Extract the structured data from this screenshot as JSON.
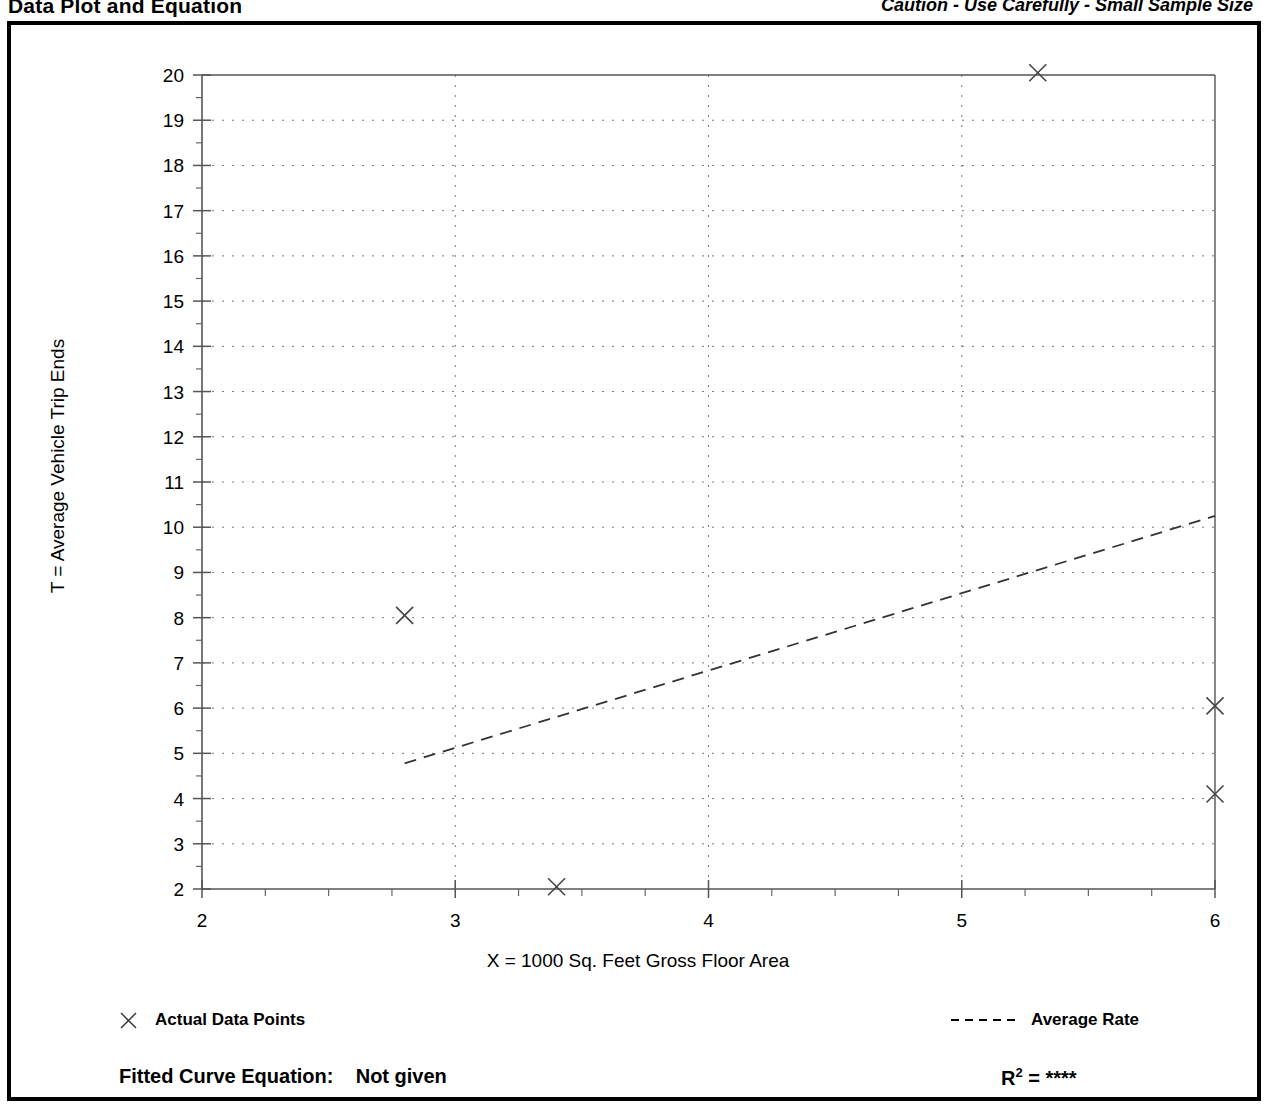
{
  "header": {
    "title": "Data Plot and Equation",
    "caution": "Caution - Use Carefully - Small Sample Size"
  },
  "legend": {
    "data_points_label": "Actual Data Points",
    "average_rate_label": "Average Rate",
    "marker_icon": "x-marker-icon",
    "line_icon": "dashed-line-icon"
  },
  "footer": {
    "equation_label": "Fitted Curve Equation:",
    "equation_value": "Not given",
    "r_squared_label": "R",
    "r_squared_exponent": "2",
    "r_squared_eq": "=",
    "r_squared_value": "****"
  },
  "chart_data": {
    "type": "scatter",
    "title": "Data Plot and Equation",
    "xlabel": "X = 1000 Sq. Feet Gross Floor Area",
    "ylabel": "T = Average Vehicle Trip Ends",
    "xlim": [
      2,
      6
    ],
    "ylim": [
      2,
      20
    ],
    "xticks": [
      2,
      3,
      4,
      5,
      6
    ],
    "xtick_labels": [
      "2",
      "3",
      "4",
      "5",
      "6"
    ],
    "yticks": [
      2,
      3,
      4,
      5,
      6,
      7,
      8,
      9,
      10,
      11,
      12,
      13,
      14,
      15,
      16,
      17,
      18,
      19,
      20
    ],
    "ytick_labels": [
      "2",
      "3",
      "4",
      "5",
      "6",
      "7",
      "8",
      "9",
      "10",
      "11",
      "12",
      "13",
      "14",
      "15",
      "16",
      "17",
      "18",
      "19",
      "20"
    ],
    "x_minor_tick_step": 0.25,
    "y_minor_tick_step": 0.5,
    "grid": true,
    "grid_style": "dotted",
    "legend_position": "below-plot",
    "series": [
      {
        "name": "Actual Data Points",
        "type": "scatter",
        "marker": "x",
        "points": [
          {
            "x": 2.8,
            "y": 8.05
          },
          {
            "x": 3.4,
            "y": 2.05
          },
          {
            "x": 5.3,
            "y": 20.05
          },
          {
            "x": 6.0,
            "y": 6.05
          },
          {
            "x": 6.0,
            "y": 4.1
          }
        ]
      },
      {
        "name": "Average Rate",
        "type": "line",
        "style": "dashed",
        "points": [
          {
            "x": 2.8,
            "y": 4.78
          },
          {
            "x": 6.0,
            "y": 10.25
          }
        ]
      }
    ]
  }
}
